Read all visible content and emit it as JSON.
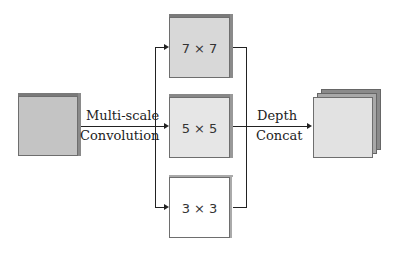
{
  "diagram": {
    "input": {
      "label": "",
      "fill": "#c4c4c4"
    },
    "left_edge_label": {
      "line1": "Multi-scale",
      "line2": "Convolution"
    },
    "branches": [
      {
        "label": "7 × 7",
        "fill": "#d8d8d8"
      },
      {
        "label": "5 × 5",
        "fill": "#e6e6e6"
      },
      {
        "label": "3 × 3",
        "fill": "#ffffff"
      }
    ],
    "right_edge_label": {
      "line1": "Depth",
      "line2": "Concat"
    },
    "output": {
      "label": "",
      "fill": "#e2e2e2",
      "stacked_layers": 3
    }
  }
}
